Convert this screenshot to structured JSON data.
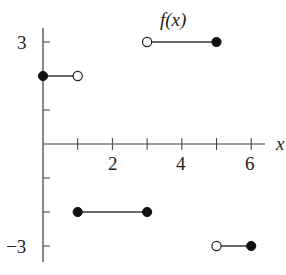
{
  "chart_data": {
    "type": "line",
    "title": "f(x)",
    "xlabel": "x",
    "ylabel": "",
    "xlim": [
      0,
      6.5
    ],
    "ylim": [
      -3.5,
      3.5
    ],
    "grid": false,
    "x_ticks": [
      1,
      2,
      3,
      4,
      5,
      6
    ],
    "x_tick_labels": [
      "",
      "2",
      "",
      "4",
      "",
      "6"
    ],
    "y_ticks": [
      -3,
      -2,
      -1,
      1,
      2,
      3
    ],
    "y_tick_labels": [
      "−3",
      "",
      "",
      "",
      "",
      "3"
    ],
    "series": [
      {
        "name": "f(x) piece 1",
        "x": [
          0,
          1
        ],
        "y": [
          2,
          2
        ],
        "endpoints": [
          "closed",
          "open"
        ]
      },
      {
        "name": "f(x) piece 2",
        "x": [
          1,
          3
        ],
        "y": [
          -2,
          -2
        ],
        "endpoints": [
          "closed",
          "closed"
        ]
      },
      {
        "name": "f(x) piece 3",
        "x": [
          3,
          5
        ],
        "y": [
          3,
          3
        ],
        "endpoints": [
          "open",
          "closed"
        ]
      },
      {
        "name": "f(x) piece 4",
        "x": [
          5,
          6
        ],
        "y": [
          -3,
          -3
        ],
        "endpoints": [
          "open",
          "closed"
        ]
      }
    ],
    "annotations": [
      {
        "text": "f(x)",
        "x": 4,
        "y": 3.6
      }
    ]
  },
  "labels": {
    "function_label": "f(x)",
    "x_axis_label": "x",
    "y3": "3",
    "yneg3": "−3",
    "x2": "2",
    "x4": "4",
    "x6": "6"
  }
}
